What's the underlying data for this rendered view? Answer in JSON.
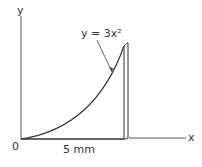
{
  "diagram": {
    "axes": {
      "x_label": "x",
      "y_label": "y",
      "origin_label": "0"
    },
    "curve": {
      "equation_label": "y = 3x²",
      "equation": "y = 3x^2"
    },
    "dimension": {
      "label": "5 mm"
    },
    "colors": {
      "stroke": "#333333",
      "background": "#ffffff"
    }
  }
}
